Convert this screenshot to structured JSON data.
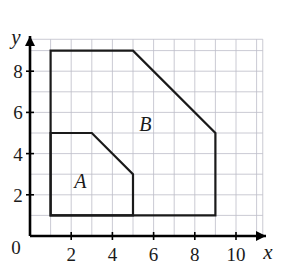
{
  "figure": {
    "background_color": "#ffffff",
    "width": 282,
    "height": 270
  },
  "axes": {
    "origin_label": "0",
    "x_axis_label": "x",
    "y_axis_label": "y",
    "x_ticks": [
      "2",
      "4",
      "6",
      "8",
      "10"
    ],
    "y_ticks": [
      "2",
      "4",
      "6",
      "8"
    ],
    "x_tick_values": [
      2,
      4,
      6,
      8,
      10
    ],
    "y_tick_values": [
      2,
      4,
      6,
      8
    ],
    "x_range": [
      0,
      11.3
    ],
    "y_range": [
      0,
      9.6
    ],
    "axis_color": "#000000",
    "arrowheads": true
  },
  "grid": {
    "visible": true,
    "spacing": 1,
    "color": "#bdbdc8",
    "x_min": 0.05,
    "x_max": 11.3,
    "y_min": 0.05,
    "y_max": 9.55
  },
  "chart_data": {
    "type": "diagram",
    "xlabel": "x",
    "ylabel": "y",
    "xlim": [
      0,
      11.3
    ],
    "ylim": [
      0,
      9.6
    ],
    "grid": true,
    "shapes": [
      {
        "name": "B",
        "label": "B",
        "label_position": [
          5.6,
          5.1
        ],
        "description": "Outer polygon with a chamfered top-right corner",
        "vertices": [
          [
            1,
            9
          ],
          [
            5,
            9
          ],
          [
            9,
            5
          ],
          [
            9,
            1
          ],
          [
            1,
            1
          ]
        ],
        "closed": true,
        "stroke": "#1a1a1a",
        "fill": "none"
      },
      {
        "name": "A",
        "label": "A",
        "label_position": [
          2.45,
          2.35
        ],
        "description": "Inner region sharing the left and bottom edges of B, with a chamfered top-right corner",
        "vertices": [
          [
            1,
            5
          ],
          [
            3,
            5
          ],
          [
            5,
            3
          ],
          [
            5,
            1
          ],
          [
            1,
            1
          ]
        ],
        "closed": true,
        "stroke": "#1a1a1a",
        "fill": "none"
      }
    ],
    "shared_edges": [
      "left edge x=1 from y=1 to y=5",
      "bottom edge y=1 from x=1 to x=5"
    ]
  },
  "styles": {
    "shape_stroke_color": "#1a1a1a",
    "shape_stroke_width": 2.2,
    "grid_stroke_width": 0.8,
    "axis_stroke_width": 2.6
  }
}
